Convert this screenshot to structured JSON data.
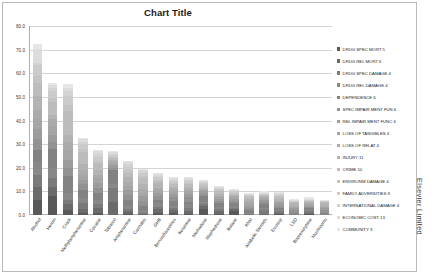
{
  "chart": {
    "title": "Chart Title",
    "credit": "Elsevier Limited"
  },
  "chart_data": {
    "type": "bar",
    "subtype": "stacked-vertical",
    "title": "Chart Title",
    "xlabel": "",
    "ylabel": "",
    "ylim": [
      0,
      80
    ],
    "ytick_labels": [
      "80.0",
      "70.0",
      "60.0",
      "50.0",
      "40.0",
      "30.0",
      "20.0",
      "10.0",
      "0.0"
    ],
    "ytick_values": [
      80,
      70,
      60,
      50,
      40,
      30,
      20,
      10,
      0
    ],
    "grid": "horizontal",
    "legend_position": "right",
    "categories": [
      "Alcohol",
      "Heroin",
      "Crack",
      "Methylamphetamine",
      "Cocaine",
      "Tobacco",
      "Amphetamine",
      "Cannabis",
      "GHB",
      "Benzodiazepines",
      "Ketamine",
      "Methadone",
      "Mephedrone",
      "Butane",
      "Khat",
      "Anabolic Steroids",
      "Ecstasy",
      "LSD",
      "Buprenorphine",
      "Mushrooms"
    ],
    "totals": [
      72.0,
      55.0,
      54.0,
      32.5,
      27.0,
      26.0,
      23.0,
      20.0,
      18.5,
      15.2,
      15.0,
      14.0,
      12.5,
      10.5,
      9.0,
      9.5,
      9.0,
      7.0,
      6.5,
      6.0
    ],
    "series": [
      {
        "name": "DRUG SPEC MORT 5",
        "color": "#595959",
        "values": [
          6.5,
          8.0,
          2.0,
          1.0,
          1.0,
          0.0,
          0.5,
          0.0,
          1.0,
          1.0,
          0.5,
          2.5,
          0.5,
          1.5,
          0.0,
          0.0,
          0.5,
          0.0,
          0.5,
          0.0
        ]
      },
      {
        "name": "DRUG REL MORT 6",
        "color": "#6b6b6b",
        "values": [
          5.5,
          4.0,
          2.5,
          1.5,
          2.0,
          5.5,
          1.0,
          0.5,
          1.5,
          1.0,
          1.0,
          1.5,
          1.0,
          1.0,
          0.0,
          0.5,
          0.5,
          0.0,
          0.5,
          0.0
        ]
      },
      {
        "name": "DRUG SPEC DAMAGE 4",
        "color": "#7a7a7a",
        "values": [
          5.0,
          3.5,
          2.0,
          2.5,
          1.5,
          6.0,
          1.0,
          0.5,
          1.0,
          1.0,
          1.5,
          0.5,
          1.0,
          0.5,
          0.5,
          1.5,
          0.5,
          0.0,
          0.5,
          0.0
        ]
      },
      {
        "name": "DRUG REL DAMAGE 4",
        "color": "#888888",
        "values": [
          5.5,
          4.5,
          3.0,
          2.0,
          2.0,
          1.5,
          1.5,
          1.0,
          1.5,
          1.0,
          1.5,
          1.0,
          1.0,
          1.0,
          0.5,
          1.0,
          0.5,
          0.5,
          0.5,
          0.5
        ]
      },
      {
        "name": "DEPENDENCE 6",
        "color": "#828282",
        "values": [
          5.0,
          8.0,
          7.0,
          3.5,
          3.0,
          6.0,
          2.5,
          2.0,
          1.5,
          2.0,
          1.0,
          2.5,
          1.5,
          1.0,
          1.0,
          1.5,
          1.0,
          0.5,
          1.0,
          0.5
        ]
      },
      {
        "name": "SPEC IMPAIR MENT FUN 6",
        "color": "#929292",
        "values": [
          4.5,
          3.0,
          3.5,
          2.5,
          2.0,
          1.0,
          2.0,
          2.0,
          1.5,
          1.5,
          2.0,
          1.0,
          1.0,
          1.0,
          1.0,
          1.0,
          1.0,
          1.0,
          0.5,
          1.0
        ]
      },
      {
        "name": "REL IMPAIR MENT FUNC 6",
        "color": "#9c9c9c",
        "values": [
          4.5,
          3.0,
          3.5,
          2.0,
          2.0,
          1.0,
          2.0,
          2.0,
          1.5,
          1.5,
          1.5,
          1.0,
          1.0,
          1.0,
          1.0,
          1.0,
          1.0,
          1.0,
          0.5,
          1.0
        ]
      },
      {
        "name": "LOSS OF TANGIBLES 4",
        "color": "#a6a6a6",
        "values": [
          4.0,
          3.5,
          4.0,
          2.0,
          2.0,
          1.0,
          2.0,
          1.5,
          1.0,
          1.0,
          1.0,
          0.5,
          0.5,
          0.5,
          1.0,
          0.5,
          0.5,
          0.5,
          0.5,
          0.5
        ]
      },
      {
        "name": "LOSS OF RELAT 4",
        "color": "#ababab",
        "values": [
          4.0,
          3.0,
          3.5,
          2.0,
          1.5,
          1.0,
          1.5,
          1.5,
          1.0,
          1.0,
          1.0,
          0.5,
          0.5,
          0.5,
          1.0,
          0.5,
          0.5,
          0.5,
          0.5,
          0.5
        ]
      },
      {
        "name": "INJURY 11",
        "color": "#b3b3b3",
        "values": [
          6.0,
          2.0,
          3.0,
          2.5,
          2.0,
          0.5,
          2.0,
          2.0,
          2.0,
          1.0,
          1.0,
          0.5,
          1.0,
          0.5,
          1.0,
          0.5,
          1.0,
          1.0,
          0.5,
          1.0
        ]
      },
      {
        "name": "CRIME 10",
        "color": "#bcbcbc",
        "values": [
          5.5,
          5.5,
          10.0,
          5.0,
          3.0,
          0.5,
          2.0,
          2.5,
          1.0,
          1.0,
          1.0,
          1.0,
          1.0,
          0.5,
          0.5,
          0.5,
          0.5,
          0.5,
          0.5,
          0.5
        ]
      },
      {
        "name": "ENVIRONM DAMAGE 4",
        "color": "#c4c4c4",
        "values": [
          3.0,
          1.5,
          2.5,
          1.5,
          1.0,
          0.5,
          1.0,
          1.0,
          0.5,
          0.5,
          0.5,
          0.5,
          0.5,
          0.5,
          0.5,
          0.0,
          0.5,
          0.0,
          0.0,
          0.0
        ]
      },
      {
        "name": "FAMILY ADVERSITIES 9",
        "color": "#cbcbcb",
        "values": [
          4.5,
          3.0,
          4.0,
          2.0,
          1.5,
          1.0,
          1.5,
          1.5,
          1.0,
          1.0,
          1.0,
          0.5,
          0.5,
          0.5,
          0.5,
          0.5,
          0.5,
          0.5,
          0.5,
          0.5
        ]
      },
      {
        "name": "INTERNATIONAL DAMAGE 4",
        "color": "#d3d3d3",
        "values": [
          1.0,
          1.5,
          2.0,
          1.0,
          1.5,
          0.5,
          1.0,
          0.5,
          0.5,
          0.5,
          0.5,
          0.5,
          0.5,
          0.0,
          0.0,
          0.0,
          0.5,
          0.0,
          0.0,
          0.0
        ]
      },
      {
        "name": "ECONOMIC COST 13",
        "color": "#dcdcdc",
        "values": [
          6.0,
          1.0,
          1.5,
          1.0,
          1.0,
          0.5,
          1.0,
          0.5,
          1.0,
          0.5,
          0.5,
          0.5,
          0.5,
          0.5,
          0.5,
          0.5,
          0.5,
          0.5,
          0.5,
          0.0
        ]
      },
      {
        "name": "COMMUNITY 3",
        "color": "#e6e6e6",
        "values": [
          2.0,
          1.0,
          1.5,
          0.5,
          0.5,
          0.5,
          0.5,
          0.5,
          0.5,
          0.5,
          0.5,
          0.5,
          0.5,
          0.5,
          0.5,
          0.5,
          0.5,
          0.5,
          0.5,
          0.5
        ]
      }
    ]
  }
}
